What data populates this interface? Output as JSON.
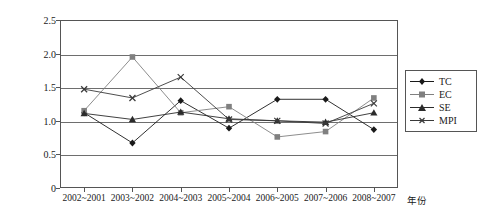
{
  "chart_data": {
    "type": "line",
    "title": "",
    "xlabel": "年份",
    "ylabel": "",
    "categories": [
      "2002~2001",
      "2003~2002",
      "2004~2003",
      "2005~2004",
      "2006~2005",
      "2007~2006",
      "2008~2007"
    ],
    "ylim": [
      0,
      2.5
    ],
    "yticks": [
      "0",
      "0.5",
      "1.0",
      "1.5",
      "2.0",
      "2.5"
    ],
    "ytick_values": [
      0,
      0.5,
      1.0,
      1.5,
      2.0,
      2.5
    ],
    "grid": true,
    "legend_position": "right",
    "series": [
      {
        "name": "TC",
        "marker": "diamond",
        "color": "#1a1a1a",
        "values": [
          1.12,
          0.67,
          1.3,
          0.89,
          1.32,
          1.32,
          0.87
        ]
      },
      {
        "name": "EC",
        "marker": "square",
        "color": "#808080",
        "values": [
          1.15,
          1.95,
          1.12,
          1.21,
          0.76,
          0.84,
          1.34
        ]
      },
      {
        "name": "SE",
        "marker": "triangle",
        "color": "#2b2b2b",
        "values": [
          1.11,
          1.02,
          1.13,
          1.03,
          1.0,
          0.98,
          1.12
        ]
      },
      {
        "name": "MPI",
        "marker": "cross",
        "color": "#3a3a3a",
        "values": [
          1.47,
          1.34,
          1.65,
          1.02,
          1.0,
          0.96,
          1.26
        ]
      }
    ]
  },
  "legend": {
    "items": [
      {
        "label": "TC"
      },
      {
        "label": "EC"
      },
      {
        "label": "SE"
      },
      {
        "label": "MPI"
      }
    ]
  }
}
